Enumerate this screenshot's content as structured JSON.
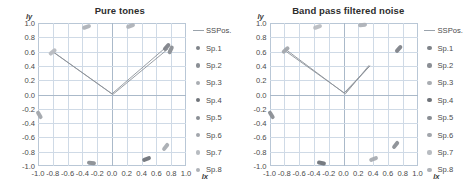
{
  "figure": {
    "panels": [
      {
        "title": "Pure tones"
      },
      {
        "title": "Band pass filtered noise"
      }
    ]
  },
  "axes": {
    "xlabel": "lx",
    "ylabel": "ly",
    "xticks": [
      "-1.0",
      "-0.8",
      "-0.6",
      "-0.4",
      "-0.2",
      "0.0",
      "0.2",
      "0.4",
      "0.6",
      "0.8",
      "1.0"
    ],
    "yticks": [
      "1.0",
      "0.8",
      "0.6",
      "0.4",
      "0.2",
      "0.0",
      "-0.2",
      "-0.4",
      "-0.6",
      "-0.8",
      "-1.0"
    ],
    "xlim": [
      -1.0,
      1.0
    ],
    "ylim": [
      -1.0,
      1.0
    ],
    "grid": true
  },
  "legend": {
    "position": "right",
    "entries": [
      {
        "label": "SSPos.",
        "key": "line",
        "color": "#9aa3ac"
      },
      {
        "label": "Sp.1",
        "key": "marker",
        "color": "#7f8389"
      },
      {
        "label": "Sp.2",
        "key": "marker",
        "color": "#8b8f95"
      },
      {
        "label": "Sp.3",
        "key": "marker",
        "color": "#a9adb2"
      },
      {
        "label": "Sp.4",
        "key": "marker",
        "color": "#70747a"
      },
      {
        "label": "Sp.5",
        "key": "marker",
        "color": "#8a8e94"
      },
      {
        "label": "Sp.6",
        "key": "marker",
        "color": "#a2a6ac"
      },
      {
        "label": "Sp.7",
        "key": "marker",
        "color": "#b8bcc1"
      },
      {
        "label": "Sp.8",
        "key": "marker",
        "color": "#aeb2b8"
      }
    ]
  },
  "chart_data": [
    {
      "type": "scatter",
      "title": "Pure tones",
      "xlabel": "lx",
      "ylabel": "ly",
      "xlim": [
        -1.0,
        1.0
      ],
      "ylim": [
        -1.0,
        1.0
      ],
      "grid": true,
      "series": [
        {
          "name": "Sp.1",
          "color": "#7f8389",
          "x": [
            0.74
          ],
          "y": [
            0.67
          ],
          "angle": -48
        },
        {
          "name": "Sp.2",
          "color": "#8b8f95",
          "x": [
            0.79
          ],
          "y": [
            0.63
          ],
          "angle": -65
        },
        {
          "name": "Sp.3",
          "color": "#a9adb2",
          "x": [
            0.72
          ],
          "y": [
            -0.73
          ],
          "angle": -52
        },
        {
          "name": "Sp.4",
          "color": "#70747a",
          "x": [
            0.46
          ],
          "y": [
            -0.9
          ],
          "angle": -20
        },
        {
          "name": "Sp.5",
          "color": "#8a8e94",
          "x": [
            -0.28
          ],
          "y": [
            -0.95
          ],
          "angle": 8
        },
        {
          "name": "Sp.6",
          "color": "#a2a6ac",
          "x": [
            -0.98
          ],
          "y": [
            -0.29
          ],
          "angle": 60
        },
        {
          "name": "Sp.7",
          "color": "#b8bcc1",
          "x": [
            -0.8
          ],
          "y": [
            0.6
          ],
          "angle": -40
        },
        {
          "name": "Sp.8",
          "color": "#aeb2b8",
          "x": [
            -0.34,
            0.25
          ],
          "y": [
            0.95,
            0.96
          ],
          "angle": -18
        }
      ],
      "sspos_line": {
        "name": "SSPos.",
        "color": "#8d939a",
        "paths": [
          [
            [
              -0.8,
              0.6
            ],
            [
              0.0,
              0.01
            ],
            [
              0.74,
              0.67
            ]
          ],
          [
            [
              -0.79,
              0.59
            ],
            [
              0.01,
              0.0
            ],
            [
              0.76,
              0.64
            ]
          ]
        ]
      }
    },
    {
      "type": "scatter",
      "title": "Band pass filtered noise",
      "xlabel": "lx",
      "ylabel": "ly",
      "xlim": [
        -1.0,
        1.0
      ],
      "ylim": [
        -1.0,
        1.0
      ],
      "grid": true,
      "series": [
        {
          "name": "Sp.1",
          "color": "#7f8389",
          "x": [
            0.74
          ],
          "y": [
            0.64
          ],
          "angle": -48
        },
        {
          "name": "Sp.2",
          "color": "#8b8f95",
          "x": [
            0.7
          ],
          "y": [
            -0.7
          ],
          "angle": -52
        },
        {
          "name": "Sp.3",
          "color": "#a9adb2",
          "x": [
            0.4
          ],
          "y": [
            -0.9
          ],
          "angle": -20
        },
        {
          "name": "Sp.4",
          "color": "#70747a",
          "x": [
            -0.3
          ],
          "y": [
            -0.95
          ],
          "angle": 10
        },
        {
          "name": "Sp.5",
          "color": "#8a8e94",
          "x": [
            -0.97
          ],
          "y": [
            -0.28
          ],
          "angle": 58
        },
        {
          "name": "Sp.6",
          "color": "#a2a6ac",
          "x": [
            -0.79
          ],
          "y": [
            0.62
          ],
          "angle": -42
        },
        {
          "name": "Sp.7",
          "color": "#b8bcc1",
          "x": [
            -0.35
          ],
          "y": [
            0.95
          ],
          "angle": -18
        },
        {
          "name": "Sp.8",
          "color": "#aeb2b8",
          "x": [
            0.26
          ],
          "y": [
            0.97
          ],
          "angle": -8
        }
      ],
      "sspos_line": {
        "name": "SSPos.",
        "color": "#8d939a",
        "paths": [
          [
            [
              -0.8,
              0.64
            ],
            [
              0.0,
              0.02
            ],
            [
              0.35,
              0.4
            ],
            [
              0.02,
              0.03
            ]
          ],
          [
            [
              -0.78,
              0.6
            ],
            [
              0.02,
              0.01
            ],
            [
              0.34,
              0.41
            ]
          ]
        ]
      }
    }
  ]
}
